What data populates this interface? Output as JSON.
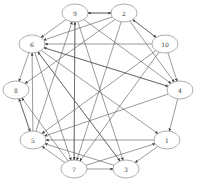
{
  "diagram": {
    "type": "directed-graph",
    "layout": "circular",
    "colors": {
      "edge": "#555555",
      "node_stroke": "#777777",
      "node_fill": "#ffffff",
      "label": "#333333"
    },
    "nodes": [
      {
        "id": "9",
        "label": "9",
        "x": 75,
        "y": 13
      },
      {
        "id": "2",
        "label": "2",
        "x": 124,
        "y": 13
      },
      {
        "id": "10",
        "label": "10",
        "x": 165,
        "y": 44
      },
      {
        "id": "4",
        "label": "4",
        "x": 180,
        "y": 90
      },
      {
        "id": "1",
        "label": "1",
        "x": 167,
        "y": 140
      },
      {
        "id": "3",
        "label": "3",
        "x": 126,
        "y": 169
      },
      {
        "id": "7",
        "label": "7",
        "x": 74,
        "y": 169
      },
      {
        "id": "5",
        "label": "5",
        "x": 33,
        "y": 140
      },
      {
        "id": "8",
        "label": "8",
        "x": 16,
        "y": 90
      },
      {
        "id": "6",
        "label": "6",
        "x": 32,
        "y": 44
      }
    ],
    "edges": [
      [
        "9",
        "2"
      ],
      [
        "2",
        "9"
      ],
      [
        "2",
        "10"
      ],
      [
        "10",
        "2"
      ],
      [
        "10",
        "4"
      ],
      [
        "2",
        "4"
      ],
      [
        "9",
        "4"
      ],
      [
        "10",
        "6"
      ],
      [
        "6",
        "4"
      ],
      [
        "4",
        "6"
      ],
      [
        "2",
        "6"
      ],
      [
        "2",
        "8"
      ],
      [
        "6",
        "8"
      ],
      [
        "8",
        "5"
      ],
      [
        "5",
        "8"
      ],
      [
        "7",
        "8"
      ],
      [
        "6",
        "3"
      ],
      [
        "6",
        "1"
      ],
      [
        "4",
        "5"
      ],
      [
        "10",
        "7"
      ],
      [
        "10",
        "5"
      ],
      [
        "2",
        "7"
      ],
      [
        "9",
        "7"
      ],
      [
        "7",
        "9"
      ],
      [
        "9",
        "3"
      ],
      [
        "5",
        "9"
      ],
      [
        "5",
        "6"
      ],
      [
        "1",
        "5"
      ],
      [
        "1",
        "3"
      ],
      [
        "4",
        "1"
      ],
      [
        "7",
        "3"
      ],
      [
        "7",
        "1"
      ],
      [
        "3",
        "5"
      ],
      [
        "7",
        "5"
      ],
      [
        "6",
        "7"
      ],
      [
        "3",
        "6"
      ],
      [
        "9",
        "6"
      ]
    ]
  }
}
